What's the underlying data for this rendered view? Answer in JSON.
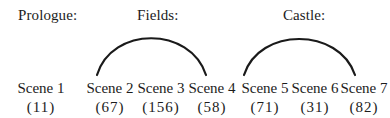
{
  "headers": [
    {
      "label": "Prologue:",
      "x": 18
    },
    {
      "label": "Fields:",
      "x": 137
    },
    {
      "label": "Castle:",
      "x": 283
    }
  ],
  "scenes": [
    {
      "label": "Scene 1",
      "count": "(11)",
      "cx": 41
    },
    {
      "label": "Scene 2",
      "count": "(67)",
      "cx": 110
    },
    {
      "label": "Scene 3",
      "count": "(156)",
      "cx": 161
    },
    {
      "label": "Scene 4",
      "count": "(58)",
      "cx": 212
    },
    {
      "label": "Scene 5",
      "count": "(71)",
      "cx": 265
    },
    {
      "label": "Scene 6",
      "count": "(31)",
      "cx": 315
    },
    {
      "label": "Scene 7",
      "count": "(82)",
      "cx": 364
    }
  ],
  "arcs": [
    {
      "group": "Fields",
      "from": "Scene 2",
      "to": "Scene 4"
    },
    {
      "group": "Castle",
      "from": "Scene 5",
      "to": "Scene 7"
    }
  ]
}
